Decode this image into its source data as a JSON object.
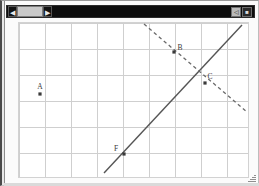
{
  "window": {
    "title": "",
    "titlebar": {
      "left_arrow_glyph": "◀",
      "right_arrow_glyph": "▶",
      "scroll_thumb_label": "",
      "minimize_glyph": "◁",
      "close_glyph": "■"
    },
    "resize_grip_label": "resize"
  },
  "canvas": {
    "width": 231,
    "height": 156,
    "background_color": "#ffffff",
    "grid": {
      "show": true,
      "color": "#cfcfcf",
      "cell_width": 26,
      "cell_height": 26,
      "vertical_lines": [
        0,
        26,
        52,
        78,
        104,
        130,
        156,
        182,
        208
      ],
      "horizontal_lines": [
        0,
        26,
        52,
        78,
        104,
        130,
        156
      ]
    },
    "lines": [
      {
        "name": "line-solid-ascending",
        "style": "solid",
        "color": "#555555",
        "x1": 85,
        "y1": 150,
        "x2": 223,
        "y2": 2
      },
      {
        "name": "line-dashed-descending",
        "style": "dashed",
        "color": "#6a6a6a",
        "x1": 125,
        "y1": 1,
        "x2": 228,
        "y2": 89
      }
    ],
    "points": [
      {
        "name": "point-a",
        "label": "A",
        "x": 21,
        "y": 71,
        "label_dx": 0,
        "label_dy": -5
      },
      {
        "name": "point-b",
        "label": "B",
        "x": 155,
        "y": 29,
        "label_dx": 6,
        "label_dy": -2
      },
      {
        "name": "point-c",
        "label": "C",
        "x": 186,
        "y": 60,
        "label_dx": 5,
        "label_dy": -4
      },
      {
        "name": "point-f",
        "label": "F",
        "x": 105,
        "y": 131,
        "label_dx": -8,
        "label_dy": -3
      }
    ]
  }
}
